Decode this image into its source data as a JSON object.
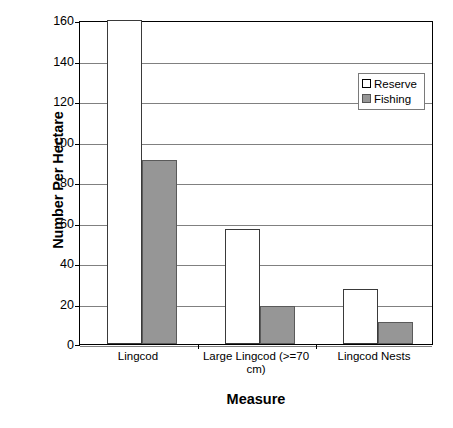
{
  "chart_data": {
    "type": "bar",
    "title": "",
    "xlabel": "Measure",
    "ylabel": "Number Per Hectare",
    "categories": [
      "Lingcod",
      "Large Lingcod (>=70 cm)",
      "Lingcod Nests"
    ],
    "series": [
      {
        "name": "Reserve",
        "color": "#ffffff",
        "values": [
          160,
          57,
          27
        ]
      },
      {
        "name": "Fishing",
        "color": "#969696",
        "values": [
          91,
          19,
          11
        ]
      }
    ],
    "ylim": [
      0,
      160
    ],
    "yticks": [
      0,
      20,
      40,
      60,
      80,
      100,
      120,
      140,
      160
    ],
    "ytick_labels": [
      "0",
      "20",
      "40",
      "60",
      "80",
      "100",
      "120",
      "140",
      "160"
    ],
    "grid": true,
    "grid_axis": "y",
    "legend_position": "top-right",
    "legend_entries": [
      "Reserve",
      "Fishing"
    ]
  },
  "axis": {
    "y_title": "Number Per Hectare",
    "x_title": "Measure"
  },
  "legend": {
    "items": [
      {
        "label": "Reserve"
      },
      {
        "label": "Fishing"
      }
    ]
  },
  "x_axis_labels": [
    "Lingcod",
    "Large Lingcod (>=70 cm)",
    "Lingcod Nests"
  ],
  "colors": {
    "reserve_fill": "#ffffff",
    "fishing_fill": "#969696",
    "axis_line": "#000000",
    "gridline": "#808080"
  },
  "caption": ""
}
